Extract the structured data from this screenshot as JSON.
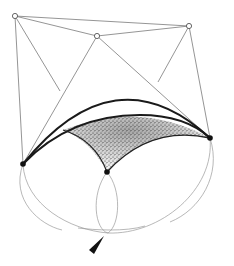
{
  "diagram": {
    "type": "geometric-construction",
    "colors": {
      "background": "#ffffff",
      "line": "#7a7a7a",
      "arc": "#1a1a1a",
      "stipple": "#333333"
    },
    "open_points": [
      {
        "id": "A",
        "x": 15,
        "y": 16
      },
      {
        "id": "B",
        "x": 97,
        "y": 36
      },
      {
        "id": "C",
        "x": 189,
        "y": 26
      }
    ],
    "filled_points": [
      {
        "id": "L",
        "x": 23,
        "y": 164
      },
      {
        "id": "M",
        "x": 107,
        "y": 172
      },
      {
        "id": "R",
        "x": 210,
        "y": 138
      }
    ],
    "pointer": {
      "x": 95,
      "y": 245,
      "direction": "up-right"
    }
  }
}
